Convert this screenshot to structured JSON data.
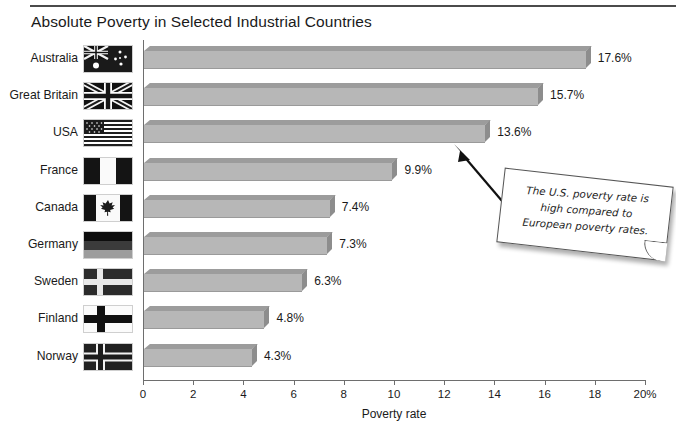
{
  "title": "Absolute Poverty in Selected Industrial Countries",
  "annotation": {
    "text": "The U.S. poverty rate is high compared to European poverty rates.",
    "points_to": "USA",
    "arrow_icon": "callout-arrow-icon"
  },
  "chart_data": {
    "type": "bar",
    "orientation": "horizontal",
    "title": "Absolute Poverty in Selected Industrial Countries",
    "xlabel": "Poverty rate",
    "ylabel": "",
    "xlim": [
      0,
      20
    ],
    "xticks": [
      0,
      2,
      4,
      6,
      8,
      10,
      12,
      14,
      16,
      18,
      20
    ],
    "xtick_labels": [
      "0",
      "2",
      "4",
      "6",
      "8",
      "10",
      "12",
      "14",
      "16",
      "18",
      "20%"
    ],
    "grid": false,
    "legend": false,
    "value_suffix": "%",
    "bar_color": "#b7b7b7",
    "bar_top_color": "#9c9c9c",
    "bar_side_color": "#8d8d8d",
    "categories": [
      "Australia",
      "Great Britain",
      "USA",
      "France",
      "Canada",
      "Germany",
      "Sweden",
      "Finland",
      "Norway"
    ],
    "values": [
      17.6,
      15.7,
      13.6,
      9.9,
      7.4,
      7.3,
      6.3,
      4.8,
      4.3
    ],
    "value_labels": [
      "17.6%",
      "15.7%",
      "13.6%",
      "9.9%",
      "7.4%",
      "7.3%",
      "6.3%",
      "4.8%",
      "4.3%"
    ],
    "flags": [
      {
        "country": "Australia",
        "icon": "flag-australia-icon"
      },
      {
        "country": "Great Britain",
        "icon": "flag-great-britain-icon"
      },
      {
        "country": "USA",
        "icon": "flag-usa-icon"
      },
      {
        "country": "France",
        "icon": "flag-france-icon"
      },
      {
        "country": "Canada",
        "icon": "flag-canada-icon"
      },
      {
        "country": "Germany",
        "icon": "flag-germany-icon"
      },
      {
        "country": "Sweden",
        "icon": "flag-sweden-icon"
      },
      {
        "country": "Finland",
        "icon": "flag-finland-icon"
      },
      {
        "country": "Norway",
        "icon": "flag-norway-icon"
      }
    ]
  }
}
